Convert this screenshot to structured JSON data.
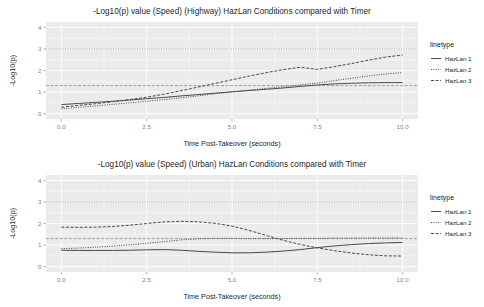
{
  "chart_data": [
    {
      "id": "highway",
      "type": "line",
      "title": "-Log10(p) value (Speed) (Highway) HazLan Conditions compared with Timer",
      "xlabel": "Time Post-Takeover (seconds)",
      "ylabel": "-Log10(p)",
      "xlim": [
        -0.45,
        10.45
      ],
      "ylim": [
        -0.25,
        4.25
      ],
      "xticks": [
        0.0,
        2.5,
        5.0,
        7.5,
        10.0
      ],
      "xticklabels": [
        "0.0",
        "2.5",
        "5.0",
        "7.5",
        "10.0"
      ],
      "yticks": [
        0,
        1,
        2,
        3,
        4
      ],
      "yticklabels": [
        "0",
        "1",
        "2",
        "3",
        "4"
      ],
      "grid": true,
      "legend_title": "linetype",
      "legend_position": "right",
      "reference_lines": [
        {
          "y": 3.0,
          "style": "dotted"
        },
        {
          "y": 1.3,
          "style": "dashed"
        }
      ],
      "x": [
        0.0,
        0.5,
        1.0,
        1.5,
        2.0,
        2.5,
        3.0,
        3.5,
        4.0,
        4.5,
        5.0,
        5.5,
        6.0,
        6.5,
        7.0,
        7.5,
        8.0,
        8.5,
        9.0,
        9.5,
        10.0
      ],
      "series": [
        {
          "name": "HazLan 1",
          "linetype": "solid",
          "values": [
            0.42,
            0.47,
            0.52,
            0.57,
            0.63,
            0.69,
            0.75,
            0.82,
            0.88,
            0.95,
            1.01,
            1.07,
            1.13,
            1.19,
            1.26,
            1.33,
            1.38,
            1.41,
            1.43,
            1.44,
            1.44
          ]
        },
        {
          "name": "HazLan 2",
          "linetype": "dotted",
          "values": [
            0.22,
            0.29,
            0.36,
            0.43,
            0.5,
            0.57,
            0.65,
            0.73,
            0.82,
            0.92,
            1.01,
            1.09,
            1.17,
            1.25,
            1.33,
            1.42,
            1.53,
            1.64,
            1.75,
            1.84,
            1.9
          ]
        },
        {
          "name": "HazLan 3",
          "linetype": "dashed",
          "values": [
            0.3,
            0.38,
            0.46,
            0.55,
            0.65,
            0.76,
            0.9,
            1.06,
            1.23,
            1.4,
            1.57,
            1.74,
            1.9,
            2.04,
            2.15,
            2.05,
            2.18,
            2.32,
            2.48,
            2.62,
            2.72
          ]
        }
      ]
    },
    {
      "id": "urban",
      "type": "line",
      "title": "-Log10(p) value (Speed) (Urban) HazLan Conditions compared with Timer",
      "xlabel": "Time Post-Takeover (seconds)",
      "ylabel": "-Log10(p)",
      "xlim": [
        -0.45,
        10.45
      ],
      "ylim": [
        -0.25,
        4.25
      ],
      "xticks": [
        0.0,
        2.5,
        5.0,
        7.5,
        10.0
      ],
      "xticklabels": [
        "0.0",
        "2.5",
        "5.0",
        "7.5",
        "10.0"
      ],
      "yticks": [
        0,
        1,
        2,
        3,
        4
      ],
      "yticklabels": [
        "0",
        "1",
        "2",
        "3",
        "4"
      ],
      "grid": true,
      "legend_title": "linetype",
      "legend_position": "right",
      "reference_lines": [
        {
          "y": 3.0,
          "style": "dotted"
        },
        {
          "y": 1.3,
          "style": "dashed"
        }
      ],
      "x": [
        0.0,
        0.5,
        1.0,
        1.5,
        2.0,
        2.5,
        3.0,
        3.5,
        4.0,
        4.5,
        5.0,
        5.5,
        6.0,
        6.5,
        7.0,
        7.5,
        8.0,
        8.5,
        9.0,
        9.5,
        10.0
      ],
      "series": [
        {
          "name": "HazLan 1",
          "linetype": "solid",
          "values": [
            0.76,
            0.75,
            0.75,
            0.75,
            0.76,
            0.78,
            0.79,
            0.76,
            0.71,
            0.67,
            0.64,
            0.64,
            0.67,
            0.72,
            0.79,
            0.88,
            0.96,
            1.02,
            1.07,
            1.1,
            1.12
          ]
        },
        {
          "name": "HazLan 2",
          "linetype": "dotted",
          "values": [
            0.83,
            0.86,
            0.9,
            0.95,
            1.01,
            1.08,
            1.16,
            1.24,
            1.29,
            1.31,
            1.31,
            1.3,
            1.3,
            1.3,
            1.31,
            1.31,
            1.32,
            1.32,
            1.33,
            1.33,
            1.33
          ]
        },
        {
          "name": "HazLan 3",
          "linetype": "dashed",
          "values": [
            1.83,
            1.82,
            1.83,
            1.86,
            1.92,
            2.0,
            2.07,
            2.1,
            2.08,
            2.01,
            1.88,
            1.68,
            1.45,
            1.22,
            1.03,
            0.87,
            0.74,
            0.63,
            0.55,
            0.5,
            0.49
          ]
        }
      ]
    }
  ],
  "legend": {
    "title": "linetype",
    "entries": [
      {
        "label": "HazLan 1",
        "linetype": "solid"
      },
      {
        "label": "HazLan 2",
        "linetype": "dotted"
      },
      {
        "label": "HazLan 3",
        "linetype": "dashed"
      }
    ]
  },
  "colors": {
    "panel_background": "#ebebeb",
    "gridline": "#ffffff",
    "line": "#4a4a4a",
    "text": "#262626",
    "tick_text": "#7f7f7f",
    "page_background": "#ffffff"
  }
}
